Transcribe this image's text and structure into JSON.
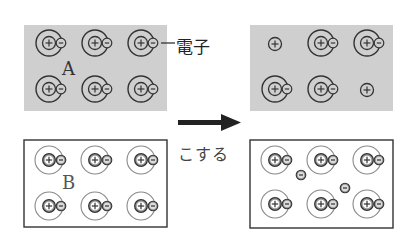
{
  "labels": {
    "box_a": "A",
    "box_b": "B",
    "electron_label": "電子",
    "arrow_caption": "こする"
  },
  "colors": {
    "shaded_box": "#cfcfcf",
    "outline": "#333333",
    "light_orbit": "#888888",
    "nucleus_fill_b": "#999999"
  },
  "diagram": {
    "before_a": {
      "atoms": 6,
      "free_nuclei": 0,
      "free_electrons": 0
    },
    "after_a": {
      "atoms": 4,
      "free_nuclei": 2,
      "free_electrons": 0
    },
    "before_b": {
      "atoms": 6,
      "free_electrons": 0
    },
    "after_b": {
      "atoms": 6,
      "free_electrons": 2
    }
  }
}
